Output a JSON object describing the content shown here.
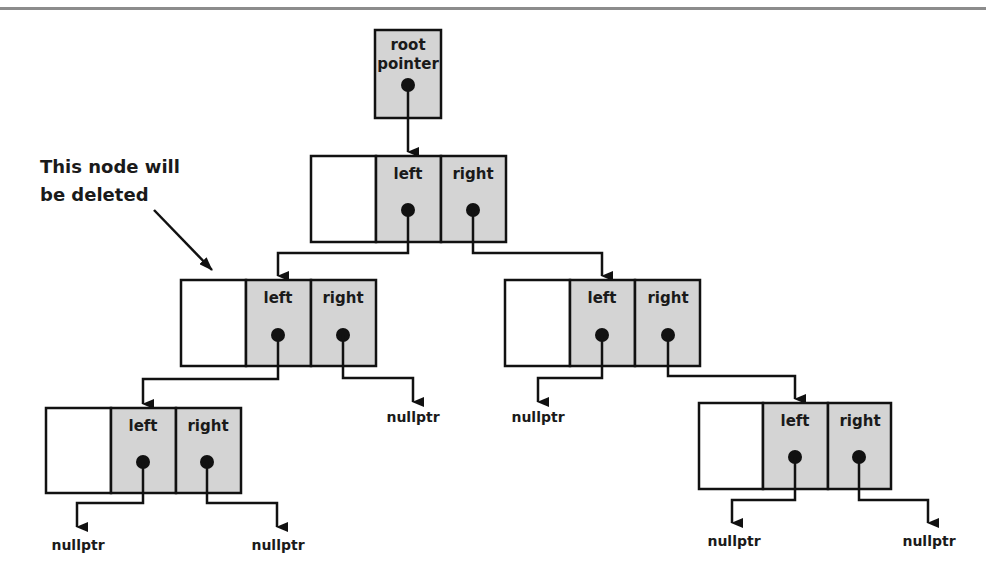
{
  "diagram": {
    "colors": {
      "pointer_cell": "#d4d4d4",
      "line": "#111111",
      "data_cell": "#ffffff",
      "top_rule": "#8c8c8c"
    },
    "root_pointer": {
      "line1": "root",
      "line2": "pointer"
    },
    "annotation": {
      "line1": "This node will",
      "line2": "be deleted"
    },
    "nodes": [
      {
        "id": "root",
        "left_label": "left",
        "right_label": "right"
      },
      {
        "id": "mid-left",
        "left_label": "left",
        "right_label": "right",
        "marked_for_deletion": true
      },
      {
        "id": "mid-right",
        "left_label": "left",
        "right_label": "right"
      },
      {
        "id": "bottom-left",
        "left_label": "left",
        "right_label": "right"
      },
      {
        "id": "bottom-right",
        "left_label": "left",
        "right_label": "right"
      }
    ],
    "null_labels": {
      "mid_left_right": "nullptr",
      "mid_right_left": "nullptr",
      "bottom_left_left": "nullptr",
      "bottom_left_right": "nullptr",
      "bottom_right_left": "nullptr",
      "bottom_right_right": "nullptr"
    }
  }
}
